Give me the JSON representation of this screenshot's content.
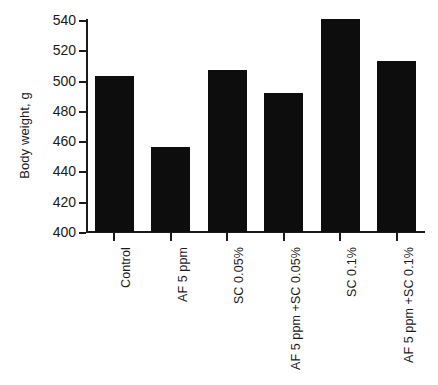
{
  "chart_data": {
    "type": "bar",
    "title": "",
    "subtitle": "",
    "xlabel": "",
    "ylabel": "Body weight, g",
    "ylim": [
      400,
      540
    ],
    "ytick_step": 20,
    "yticks": [
      400,
      420,
      440,
      460,
      480,
      500,
      520,
      540
    ],
    "ytick_labels": [
      "400",
      "420",
      "440",
      "460",
      "480",
      "500",
      "520",
      "540"
    ],
    "grid": false,
    "legend": false,
    "legend_position": "none",
    "bar_color": "#0d0d0d",
    "xtick_label_rotation": 90,
    "categories": [
      "Control",
      "AF 5 ppm",
      "SC 0.05%",
      "AF 5 ppm +SC 0.05%",
      "SC 0.1%",
      "AF 5 ppm +SC 0.1%"
    ],
    "values": [
      503,
      456,
      507,
      492,
      541,
      513
    ]
  },
  "axis": {
    "y_title": "Body weight, g"
  }
}
